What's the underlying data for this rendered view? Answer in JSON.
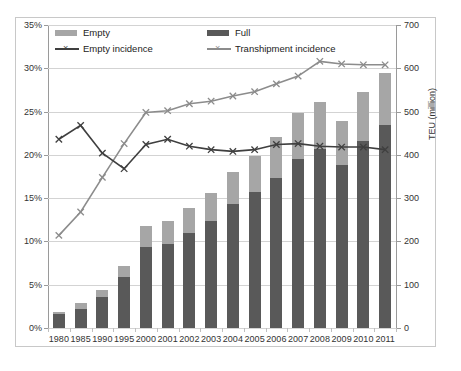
{
  "chart_data": {
    "type": "bar",
    "title": "",
    "subtitle": "",
    "xlabel": "",
    "ylabel": "",
    "ylabel_right": "TEU (million)",
    "grid": true,
    "legend_position": "top-left-inside",
    "categories": [
      "1980",
      "1985",
      "1990",
      "1995",
      "2000",
      "2001",
      "2002",
      "2003",
      "2004",
      "2005",
      "2006",
      "2007",
      "2008",
      "2009",
      "2010",
      "2011"
    ],
    "left_axis": {
      "min": 0,
      "max": 35,
      "step": 5,
      "unit": "%",
      "ticks": [
        "0%",
        "5%",
        "10%",
        "15%",
        "20%",
        "25%",
        "30%",
        "35%"
      ]
    },
    "right_axis": {
      "min": 0,
      "max": 700,
      "step": 100,
      "unit": "TEU (million)",
      "ticks": [
        "0",
        "100",
        "200",
        "300",
        "400",
        "500",
        "600",
        "700"
      ]
    },
    "series": [
      {
        "name": "Full",
        "type": "bar",
        "stack": "teu",
        "axis": "right",
        "color": "#595959",
        "values": [
          32,
          45,
          72,
          117,
          186,
          193,
          219,
          248,
          286,
          315,
          347,
          390,
          413,
          376,
          432,
          469
        ]
      },
      {
        "name": "Empty",
        "type": "bar",
        "stack": "teu",
        "axis": "right",
        "color": "#a6a6a6",
        "values": [
          6,
          12,
          15,
          26,
          49,
          54,
          59,
          64,
          75,
          83,
          94,
          107,
          110,
          103,
          113,
          121
        ]
      },
      {
        "name": "Empty incidence",
        "type": "line",
        "axis": "left",
        "color": "#3f3f3f",
        "marker": "x",
        "values": [
          21.8,
          23.4,
          20.2,
          18.4,
          21.2,
          21.8,
          21.0,
          20.6,
          20.4,
          20.6,
          21.2,
          21.3,
          21.0,
          20.9,
          20.9,
          20.6
        ]
      },
      {
        "name": "Transhipment incidence",
        "type": "line",
        "axis": "left",
        "color": "#8c8c8c",
        "marker": "x",
        "values": [
          10.7,
          13.4,
          17.4,
          21.3,
          24.9,
          25.1,
          25.9,
          26.2,
          26.8,
          27.3,
          28.2,
          29.1,
          30.8,
          30.5,
          30.4,
          30.4
        ]
      }
    ],
    "stacked_totals": [
      38,
      57,
      87,
      143,
      235,
      247,
      278,
      312,
      361,
      398,
      441,
      497,
      523,
      479,
      545,
      590
    ]
  },
  "legend": {
    "items": [
      {
        "label": "Empty",
        "kind": "swatch",
        "color": "#a6a6a6"
      },
      {
        "label": "Full",
        "kind": "swatch",
        "color": "#595959"
      },
      {
        "label": "Empty incidence",
        "kind": "line-marker",
        "color": "#3f3f3f"
      },
      {
        "label": "Transhipment incidence",
        "kind": "line-marker",
        "color": "#8c8c8c"
      }
    ]
  }
}
